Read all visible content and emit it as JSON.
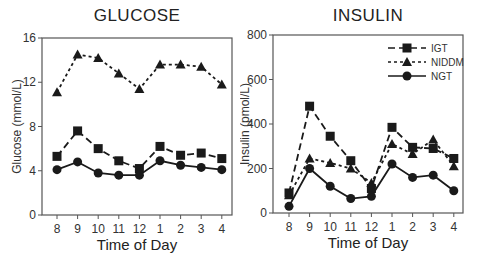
{
  "chart_data": [
    {
      "type": "line",
      "title": "GLUCOSE",
      "xlabel": "Time of Day",
      "ylabel": "Glucose (mmol/L)",
      "categories": [
        "8",
        "9",
        "10",
        "11",
        "12",
        "1",
        "2",
        "3",
        "4"
      ],
      "ylim": [
        0,
        16
      ],
      "yticks": [
        0,
        4,
        8,
        12,
        16
      ],
      "grid": false,
      "series": [
        {
          "name": "IGT",
          "marker": "square",
          "line": "dashed",
          "values": [
            5.3,
            7.6,
            6.0,
            4.9,
            4.2,
            6.2,
            5.4,
            5.6,
            5.1
          ]
        },
        {
          "name": "NIDDM",
          "marker": "triangle",
          "line": "dotted",
          "values": [
            11.1,
            14.5,
            14.2,
            12.8,
            11.4,
            13.6,
            13.6,
            13.4,
            11.8
          ]
        },
        {
          "name": "NGT",
          "marker": "circle",
          "line": "solid",
          "values": [
            4.1,
            4.8,
            3.8,
            3.6,
            3.6,
            4.9,
            4.5,
            4.3,
            4.1
          ]
        }
      ]
    },
    {
      "type": "line",
      "title": "INSULIN",
      "xlabel": "Time of Day",
      "ylabel": "Insulin (pmol/L)",
      "categories": [
        "8",
        "9",
        "10",
        "11",
        "12",
        "1",
        "2",
        "3",
        "4"
      ],
      "ylim": [
        0,
        800
      ],
      "yticks": [
        0,
        200,
        400,
        600,
        800
      ],
      "grid": false,
      "legend_position": "upper right",
      "series": [
        {
          "name": "IGT",
          "marker": "square",
          "line": "dashed",
          "values": [
            90,
            480,
            345,
            235,
            110,
            385,
            295,
            290,
            245
          ]
        },
        {
          "name": "NIDDM",
          "marker": "triangle",
          "line": "dotted",
          "values": [
            80,
            245,
            225,
            200,
            135,
            310,
            265,
            330,
            210
          ]
        },
        {
          "name": "NGT",
          "marker": "circle",
          "line": "solid",
          "values": [
            30,
            200,
            120,
            65,
            75,
            220,
            160,
            170,
            100
          ]
        }
      ]
    }
  ],
  "legend": {
    "items": [
      {
        "label": "IGT"
      },
      {
        "label": "NIDDM"
      },
      {
        "label": "NGT"
      }
    ]
  },
  "colors": {
    "ink": "#1a1a1a",
    "axis": "#555555",
    "background": "#ffffff"
  }
}
